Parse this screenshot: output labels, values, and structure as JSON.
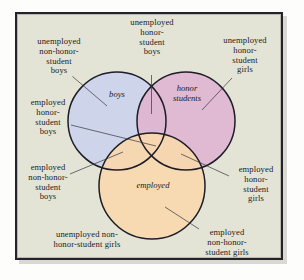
{
  "figure": {
    "type": "venn-diagram",
    "sets": 3,
    "background_color": "#e4e4d6",
    "frame_color": "#23232f"
  },
  "circles": {
    "boys": {
      "label": "boys",
      "color": "#ccd3ec",
      "stroke": "#1d1d28",
      "cx": 117,
      "cy": 121,
      "r": 49
    },
    "honor_students": {
      "label": "honor\nstudents",
      "color": "#e0b6d2",
      "stroke": "#1d1d28",
      "cx": 186,
      "cy": 121,
      "r": 49
    },
    "employed": {
      "label": "employed",
      "color": "#f8dab0",
      "stroke": "#1d1d28",
      "cx": 152,
      "cy": 186,
      "r": 53
    }
  },
  "region_labels": [
    {
      "id": "unemployed-non-honor-student-boys",
      "text": "unemployed\nnon-honor-\nstudent\nboys",
      "region": "boys only"
    },
    {
      "id": "unemployed-honor-student-boys",
      "text": "unemployed\nhonor-\nstudent\nboys",
      "region": "boys and honor students"
    },
    {
      "id": "unemployed-honor-student-girls",
      "text": "unemployed\nhonor-\nstudent\ngirls",
      "region": "honor students only"
    },
    {
      "id": "employed-honor-student-boys",
      "text": "employed\nhonor-\nstudent\nboys",
      "region": "boys and honor students and employed"
    },
    {
      "id": "employed-non-honor-student-boys",
      "text": "employed\nnon-honor-\nstudent\nboys",
      "region": "boys and employed"
    },
    {
      "id": "employed-honor-student-girls",
      "text": "employed\nhonor-\nstudent\ngirls",
      "region": "honor students and employed"
    },
    {
      "id": "unemployed-non-honor-student-girls",
      "text": "unemployed non-\nhonor-student girls",
      "region": "outside all circles"
    },
    {
      "id": "employed-non-honor-student-girls",
      "text": "employed\nnon-honor-\nstudent girls",
      "region": "employed only"
    }
  ]
}
